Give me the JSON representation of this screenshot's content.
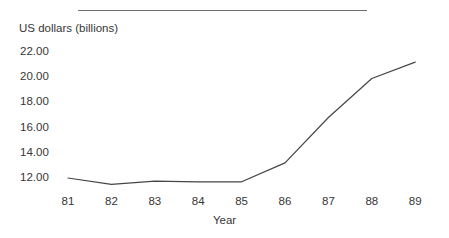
{
  "chart_data": {
    "type": "line",
    "title": "",
    "xlabel": "Year",
    "ylabel": "US dollars (billions)",
    "categories": [
      "81",
      "82",
      "83",
      "84",
      "85",
      "86",
      "87",
      "88",
      "89"
    ],
    "x": [
      81,
      82,
      83,
      84,
      85,
      86,
      87,
      88,
      89
    ],
    "values": [
      12.0,
      11.5,
      11.75,
      11.7,
      11.7,
      13.2,
      16.8,
      19.9,
      21.2
    ],
    "series": [
      {
        "name": "US dollars (billions)",
        "values": [
          12.0,
          11.5,
          11.75,
          11.7,
          11.7,
          13.2,
          16.8,
          19.9,
          21.2
        ]
      }
    ],
    "ytick_labels": [
      "22.00",
      "20.00",
      "18.00",
      "16.00",
      "14.00",
      "12.00"
    ],
    "ytick_values": [
      22.0,
      20.0,
      18.0,
      16.0,
      14.0,
      12.0
    ],
    "ylim": [
      11.0,
      22.6
    ],
    "xlim": [
      81,
      89
    ],
    "grid": false,
    "legend": "none",
    "line_color": "#454545",
    "text_color": "#363636",
    "rule_color": "#6e6e6e",
    "background": "#ffffff"
  }
}
